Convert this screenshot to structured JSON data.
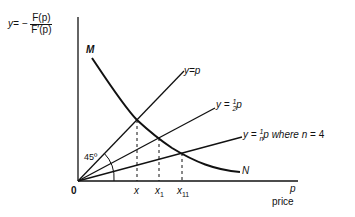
{
  "yaxis_label": {
    "prefix": "y= −",
    "numerator": "F(p)",
    "denominator": "F′(p)"
  },
  "curve": {
    "start_label": "M",
    "end_label": "N"
  },
  "lines": [
    {
      "id": "y_eq_p",
      "label": "y=p"
    },
    {
      "id": "y_half_p",
      "label_prefix": "y =",
      "frac_num": "1",
      "frac_den": "2",
      "label_suffix": "p"
    },
    {
      "id": "y_over_n_p",
      "label_prefix": "y =",
      "frac_num": "1",
      "frac_den": "n",
      "label_suffix": "p where",
      "n_label": "n",
      "n_value": "= 4"
    }
  ],
  "angle_label": "45º",
  "origin_label": "0",
  "x_ticks": [
    {
      "label": "x",
      "sub": ""
    },
    {
      "label": "x",
      "sub": "1"
    },
    {
      "label": "x",
      "sub": "11"
    }
  ],
  "xaxis_label": {
    "symbol": "p",
    "text": "price"
  }
}
